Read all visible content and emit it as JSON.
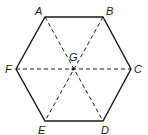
{
  "diagram": {
    "type": "regular-hexagon",
    "stroke_color": "#1a1a1a",
    "vertices": [
      {
        "label": "A",
        "x": 45,
        "y": 17,
        "lx": 35,
        "ly": 15
      },
      {
        "label": "B",
        "x": 103,
        "y": 17,
        "lx": 106,
        "ly": 15
      },
      {
        "label": "C",
        "x": 131,
        "y": 69,
        "lx": 134,
        "ly": 73
      },
      {
        "label": "D",
        "x": 103,
        "y": 121,
        "lx": 101,
        "ly": 134
      },
      {
        "label": "E",
        "x": 45,
        "y": 121,
        "lx": 38,
        "ly": 134
      },
      {
        "label": "F",
        "x": 16,
        "y": 69,
        "lx": 5,
        "ly": 73
      }
    ],
    "center": {
      "label": "G",
      "x": 73,
      "y": 69,
      "lx": 69,
      "ly": 61
    },
    "diagonals": [
      "AD",
      "BE",
      "CF"
    ],
    "diagonal_style": "dashed"
  }
}
